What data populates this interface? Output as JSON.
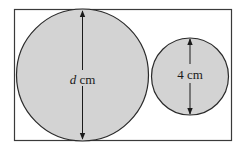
{
  "diagram": {
    "large_circle": {
      "label_var": "d",
      "label_unit": " cm",
      "fill": "#d3d3d3"
    },
    "small_circle": {
      "label": "4 cm",
      "fill": "#d3d3d3"
    },
    "stroke": "#2a2a2a",
    "background": "#ffffff"
  }
}
